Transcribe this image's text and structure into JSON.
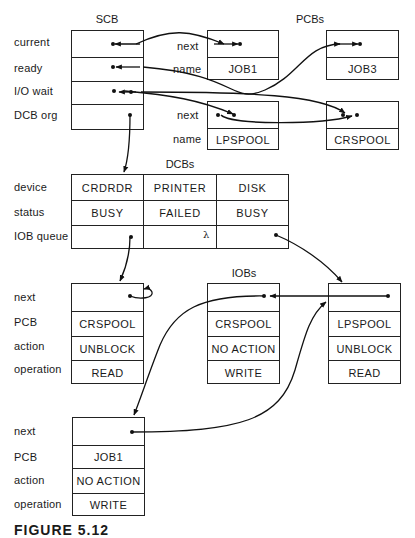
{
  "scb": {
    "title": "SCB",
    "fields": [
      "current",
      "ready",
      "I/O wait",
      "DCB org"
    ]
  },
  "pcbs": {
    "title": "PCBs",
    "field_labels": [
      "next",
      "name"
    ],
    "items": [
      {
        "name": "JOB1"
      },
      {
        "name": "JOB3"
      },
      {
        "name": "LPSPOOL"
      },
      {
        "name": "CRSPOOL"
      }
    ]
  },
  "dcbs": {
    "title": "DCBs",
    "field_labels": [
      "device",
      "status",
      "IOB queue"
    ],
    "columns": [
      {
        "device": "CRDRDR",
        "status": "BUSY",
        "iob_queue": ""
      },
      {
        "device": "PRINTER",
        "status": "FAILED",
        "iob_queue": "λ"
      },
      {
        "device": "DISK",
        "status": "BUSY",
        "iob_queue": ""
      }
    ]
  },
  "iobs": {
    "title": "IOBs",
    "field_labels": [
      "next",
      "PCB",
      "action",
      "operation"
    ],
    "items": [
      {
        "pcb": "CRSPOOL",
        "action": "UNBLOCK",
        "operation": "READ"
      },
      {
        "pcb": "CRSPOOL",
        "action": "NO ACTION",
        "operation": "WRITE"
      },
      {
        "pcb": "LPSPOOL",
        "action": "UNBLOCK",
        "operation": "READ"
      },
      {
        "pcb": "JOB1",
        "action": "NO ACTION",
        "operation": "WRITE"
      }
    ]
  },
  "caption": "FIGURE 5.12"
}
